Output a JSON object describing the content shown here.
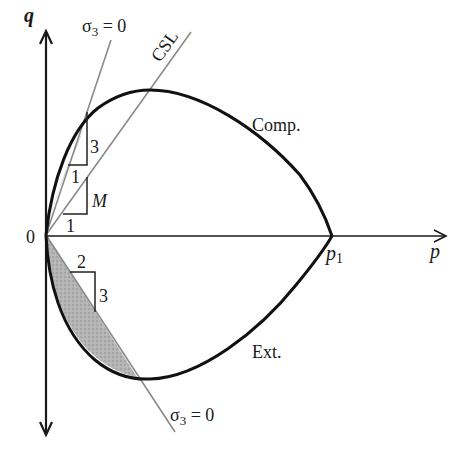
{
  "diagram": {
    "axes": {
      "q_label": "q",
      "p_label": "p",
      "origin_label": "0",
      "p1_label": "p",
      "p1_subscript": "1"
    },
    "lines": {
      "csl_label": "CSL",
      "sigma3_upper_label": "σ",
      "sigma3_upper_sub": "3",
      "sigma3_upper_eq": " = 0",
      "sigma3_lower_label": "σ",
      "sigma3_lower_sub": "3",
      "sigma3_lower_eq": " = 0"
    },
    "curves": {
      "compression_label": "Comp.",
      "extension_label": "Ext."
    },
    "slope_triangles": {
      "sigma3_comp": {
        "rise": "3",
        "run": "1"
      },
      "csl": {
        "rise": "M",
        "run": "1"
      },
      "sigma3_ext": {
        "rise": "3",
        "run": "2"
      }
    },
    "colors": {
      "curve": "#111111",
      "guide_line": "#8a8a8a",
      "shading": "#a8a8a8"
    }
  }
}
